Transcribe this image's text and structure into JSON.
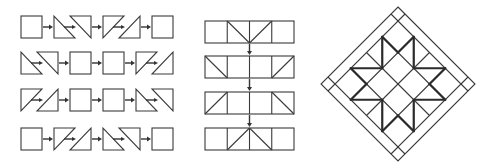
{
  "diagram": {
    "colors": {
      "line": "#3a3a3a",
      "thick_line": "#2a2a2a",
      "background": "#ffffff"
    },
    "panels": [
      {
        "id": "unit-rows",
        "rows": [
          {
            "pieces": [
              "square",
              "hst-pair-backslash",
              "hst-pair-slash",
              "square"
            ]
          },
          {
            "pieces": [
              "hst-pair-backslash",
              "square",
              "square",
              "hst-pair-slash"
            ]
          },
          {
            "pieces": [
              "hst-pair-slash",
              "square",
              "square",
              "hst-pair-backslash"
            ]
          },
          {
            "pieces": [
              "square",
              "hst-pair-slash",
              "hst-pair-backslash",
              "square"
            ]
          }
        ],
        "connector": "arrow-right"
      },
      {
        "id": "joined-rows",
        "rows": [
          {
            "cells": [
              "empty",
              "diag-tl-br",
              "diag-bl-tr",
              "empty"
            ]
          },
          {
            "cells": [
              "diag-tl-br",
              "empty",
              "empty",
              "diag-bl-tr"
            ]
          },
          {
            "cells": [
              "diag-bl-tr",
              "empty",
              "empty",
              "diag-tl-br"
            ]
          },
          {
            "cells": [
              "empty",
              "diag-bl-tr",
              "diag-tl-br",
              "empty"
            ]
          }
        ],
        "connector": "arrow-down"
      },
      {
        "id": "finished-block",
        "shape": "diamond-on-point",
        "grid": "4x4",
        "motif": "sawtooth-star",
        "border": "double-line-with-corner-squares"
      }
    ]
  }
}
